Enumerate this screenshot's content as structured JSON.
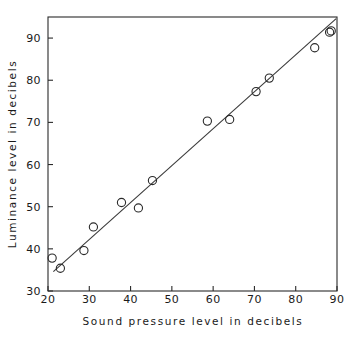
{
  "chart_data": {
    "type": "scatter",
    "title": "",
    "xlabel": "Sound pressure level in decibels",
    "ylabel": "Luminance level in decibels",
    "xlim": [
      20,
      90
    ],
    "ylim": [
      30,
      95
    ],
    "xticks": [
      20,
      30,
      40,
      50,
      60,
      70,
      80,
      90
    ],
    "yticks": [
      30,
      40,
      50,
      60,
      70,
      80,
      90
    ],
    "xtick_labels": [
      "20",
      "30",
      "40",
      "50",
      "60",
      "70",
      "80",
      "90"
    ],
    "ytick_labels": [
      "30",
      "40",
      "50",
      "60",
      "70",
      "80",
      "90"
    ],
    "grid": false,
    "legend": null,
    "marker": "open-circle",
    "points": [
      {
        "x": 21.0,
        "y": 37.8
      },
      {
        "x": 23.0,
        "y": 35.4
      },
      {
        "x": 28.7,
        "y": 39.6
      },
      {
        "x": 31.0,
        "y": 45.2
      },
      {
        "x": 37.8,
        "y": 51.0
      },
      {
        "x": 41.9,
        "y": 49.7
      },
      {
        "x": 45.3,
        "y": 56.2
      },
      {
        "x": 58.6,
        "y": 70.3
      },
      {
        "x": 64.0,
        "y": 70.7
      },
      {
        "x": 70.4,
        "y": 77.3
      },
      {
        "x": 73.6,
        "y": 80.5
      },
      {
        "x": 84.6,
        "y": 87.7
      },
      {
        "x": 88.2,
        "y": 91.4
      },
      {
        "x": 88.6,
        "y": 91.7
      }
    ],
    "fit_line": {
      "x_start": 21.3,
      "y_start": 34.6,
      "x_end": 89.8,
      "y_end": 94.6
    },
    "colors": {
      "axis": "#2a2a2a",
      "marker": "#2a2a2a",
      "line": "#3a3a3a",
      "background": "#ffffff"
    }
  }
}
